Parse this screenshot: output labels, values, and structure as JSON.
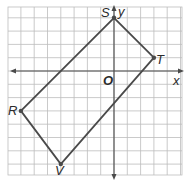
{
  "figure": {
    "type": "coordinate-plane",
    "grid": {
      "x_min": -8,
      "x_max": 5,
      "y_min": -8,
      "y_max": 5,
      "origin_px": [
        114,
        71
      ],
      "unit_px": 13.3,
      "left_px": 8,
      "top_px": 7,
      "right_px": 182,
      "bottom_px": 175
    },
    "axes": {
      "x_label": "x",
      "y_label": "y",
      "origin_label": "O"
    },
    "polygon": {
      "name": "RSTV",
      "shape": "rectangle",
      "stroke_color": "#4a4a4a",
      "vertices": [
        {
          "label": "S",
          "x": 0,
          "y": 4
        },
        {
          "label": "T",
          "x": 3,
          "y": 1
        },
        {
          "label": "V",
          "x": -4,
          "y": -7
        },
        {
          "label": "R",
          "x": -7,
          "y": -3
        }
      ]
    },
    "colors": {
      "grid": "#bdbdbd",
      "axis": "#4a4a4a",
      "polygon": "#4a4a4a",
      "text": "#2b2b2b"
    }
  }
}
